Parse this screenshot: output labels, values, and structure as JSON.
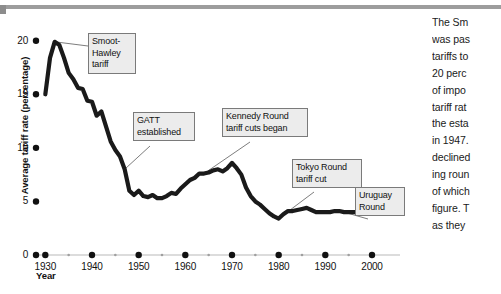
{
  "chart_data": {
    "type": "line",
    "title": "",
    "xlabel": "Year",
    "ylabel": "Average tariff rate (percentage)",
    "xlim": [
      1928,
      2006
    ],
    "ylim": [
      0,
      21
    ],
    "grid": false,
    "legend": null,
    "x_ticks": [
      "1930",
      "1940",
      "1950",
      "1960",
      "1970",
      "1980",
      "1990",
      "2000"
    ],
    "x_tick_values": [
      1930,
      1940,
      1950,
      1960,
      1970,
      1980,
      1990,
      2000
    ],
    "x_minor_values": [
      1935,
      1945,
      1955,
      1965,
      1975,
      1985,
      1995
    ],
    "y_ticks": [
      "0",
      "5",
      "10",
      "15",
      "20"
    ],
    "y_tick_values": [
      0,
      5,
      10,
      15,
      20
    ],
    "series": [
      {
        "name": "Average tariff rate",
        "x": [
          1930,
          1931,
          1932,
          1933,
          1934,
          1935,
          1936,
          1937,
          1938,
          1939,
          1940,
          1941,
          1942,
          1943,
          1944,
          1945,
          1946,
          1947,
          1948,
          1949,
          1950,
          1951,
          1952,
          1953,
          1954,
          1955,
          1956,
          1957,
          1958,
          1959,
          1960,
          1961,
          1962,
          1963,
          1964,
          1965,
          1966,
          1967,
          1968,
          1969,
          1970,
          1971,
          1972,
          1973,
          1974,
          1975,
          1976,
          1977,
          1978,
          1979,
          1980,
          1981,
          1982,
          1983,
          1984,
          1985,
          1986,
          1987,
          1988,
          1989,
          1990,
          1991,
          1992,
          1993,
          1994,
          1995,
          1996,
          1997
        ],
        "values": [
          15.0,
          18.4,
          19.9,
          19.6,
          18.4,
          17.0,
          16.4,
          15.6,
          15.5,
          14.4,
          14.3,
          13.0,
          13.4,
          12.0,
          10.6,
          9.8,
          9.2,
          8.0,
          6.0,
          5.6,
          6.0,
          5.5,
          5.4,
          5.6,
          5.3,
          5.3,
          5.5,
          5.8,
          5.7,
          6.2,
          6.6,
          7.0,
          7.2,
          7.6,
          7.6,
          7.7,
          7.9,
          8.0,
          7.8,
          8.1,
          8.6,
          8.1,
          7.5,
          6.3,
          5.5,
          5.0,
          4.7,
          4.3,
          3.9,
          3.6,
          3.4,
          3.8,
          4.1,
          4.1,
          4.2,
          4.3,
          4.4,
          4.2,
          4.0,
          4.0,
          4.0,
          4.0,
          4.1,
          4.1,
          4.0,
          4.0,
          4.0,
          4.0
        ]
      }
    ],
    "annotations": [
      {
        "id": "smoot-hawley",
        "label": "Smoot-\nHawley\ntariff",
        "point_x": 1932,
        "point_y": 19.9
      },
      {
        "id": "gatt-established",
        "label": "GATT\nestablished",
        "point_x": 1947,
        "point_y": 8.0
      },
      {
        "id": "kennedy-round",
        "label": "Kennedy Round\ntariff cuts began",
        "point_x": 1964,
        "point_y": 7.6
      },
      {
        "id": "tokyo-round",
        "label": "Tokyo Round\ntariff cut",
        "point_x": 1980,
        "point_y": 3.4
      },
      {
        "id": "uruguay-round",
        "label": "Uruguay\nRound",
        "point_x": 1994,
        "point_y": 4.0
      }
    ]
  },
  "side_text": {
    "lines": [
      "The Sm",
      "was pas",
      "tariffs to",
      "20 perc",
      "of impo",
      "tariff rat",
      "the esta",
      "in 1947.",
      "declined",
      "ing roun",
      "of which",
      "figure. T",
      "as they"
    ]
  },
  "colors": {
    "line": "#1a1a1a",
    "axis": "#b0b0b0",
    "rule": "#9d9d9d",
    "callout_bg": "#ececec",
    "callout_border": "#7a7a7a",
    "text": "#111111"
  }
}
